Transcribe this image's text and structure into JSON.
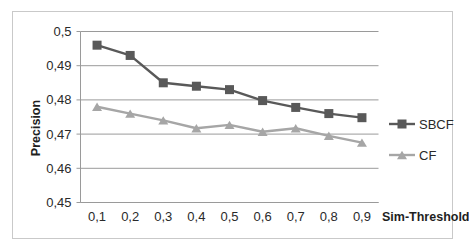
{
  "chart_data": {
    "type": "line",
    "title": "",
    "xlabel": "Sim-Threshold",
    "ylabel": "Precision",
    "categories": [
      "0,1",
      "0,2",
      "0,3",
      "0,4",
      "0,5",
      "0,6",
      "0,7",
      "0,8",
      "0,9"
    ],
    "x_tick_labels": [
      "0,1",
      "0,2",
      "0,3",
      "0,4",
      "0,5",
      "0,6",
      "0,7",
      "0,8",
      "0,9"
    ],
    "y_tick_labels": [
      "0,45",
      "0,46",
      "0,47",
      "0,48",
      "0,49",
      "0,5"
    ],
    "y_tick_values": [
      0.45,
      0.46,
      0.47,
      0.48,
      0.49,
      0.5
    ],
    "ylim": [
      0.45,
      0.5
    ],
    "grid": "horizontal",
    "legend_position": "right",
    "series": [
      {
        "name": "SBCF",
        "color": "#595959",
        "marker": "square",
        "values": [
          0.496,
          0.493,
          0.485,
          0.484,
          0.483,
          0.4798,
          0.4778,
          0.476,
          0.4748
        ]
      },
      {
        "name": "CF",
        "color": "#a6a6a6",
        "marker": "triangle",
        "values": [
          0.478,
          0.476,
          0.474,
          0.4717,
          0.4727,
          0.4707,
          0.4717,
          0.4695,
          0.4675
        ]
      }
    ]
  },
  "legend": {
    "items": [
      {
        "label": "SBCF",
        "color": "#595959",
        "marker": "square"
      },
      {
        "label": "CF",
        "color": "#a6a6a6",
        "marker": "triangle"
      }
    ]
  },
  "axes": {
    "y_title": "Precision",
    "x_title": "Sim-Threshold"
  },
  "colors": {
    "sbcf": "#595959",
    "cf": "#a6a6a6",
    "gridline": "#9a9a9a",
    "axis": "#9a9a9a",
    "frame": "#c9c9c9",
    "text": "#2a2a2a",
    "background": "#ffffff"
  }
}
